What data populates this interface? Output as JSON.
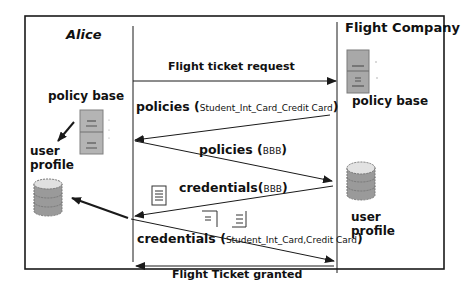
{
  "diagram": {
    "type": "sequence",
    "actors": [
      {
        "id": "alice",
        "name": "Alice"
      },
      {
        "id": "flight_company",
        "name": "Flight Company"
      }
    ],
    "alice": {
      "policy_base_label": "policy base",
      "user_profile_label": [
        "user",
        "profile"
      ]
    },
    "flight_company": {
      "policy_base_label": "policy base",
      "user_profile_label": [
        "user",
        "profile"
      ]
    },
    "messages": [
      {
        "from": "alice",
        "to": "flight_company",
        "label": "Flight ticket request",
        "args": ""
      },
      {
        "from": "flight_company",
        "to": "alice",
        "label": "policies (",
        "args": "Student_Int_Card_Credit Card",
        "close": ")"
      },
      {
        "from": "alice",
        "to": "flight_company",
        "label": "policies (",
        "args": "BBB",
        "close": ")"
      },
      {
        "from": "flight_company",
        "to": "alice",
        "label": "credentials(",
        "args": "BBB",
        "close": ")"
      },
      {
        "from": "alice",
        "to": "flight_company",
        "label": "credentials (",
        "args": "Student_Int_Card,Credit Card",
        "close": ")"
      },
      {
        "from": "flight_company",
        "to": "alice",
        "label": "Flight Ticket granted",
        "args": ""
      }
    ],
    "colors": {
      "line": "#1a1a1a",
      "cabinet": "#a9a9a9",
      "db_top": "#e0e0e0",
      "db_body": "#9a9a9a",
      "doc": "#ffffff"
    }
  }
}
